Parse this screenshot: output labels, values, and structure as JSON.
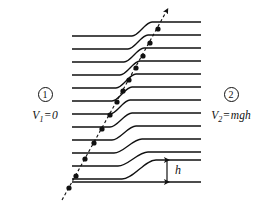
{
  "figure": {
    "kind": "physics-potential-step-diagram",
    "width": 265,
    "height": 216,
    "background_color": "#ffffff",
    "line_color": "#111111"
  },
  "regions": {
    "left": {
      "marker": "1",
      "marker_style": "circled-number",
      "potential_symbol": "V",
      "potential_subscript": "1",
      "equals": "=",
      "potential_value": "0"
    },
    "right": {
      "marker": "2",
      "marker_style": "circled-number",
      "potential_symbol": "V",
      "potential_subscript": "2",
      "equals": "=",
      "potential_value": "mgh"
    }
  },
  "height_marker": {
    "label": "h",
    "arrow": "double-headed-vertical",
    "x": 167,
    "y_top": 160,
    "y_bottom": 182
  },
  "chart_data": {
    "type": "line",
    "title": "",
    "xlabel": "",
    "ylabel": "",
    "grid": false,
    "legend": false,
    "step_lines": {
      "count": 13,
      "left_x": 72,
      "right_x": 201,
      "stroke_width": 1.3,
      "rows": [
        {
          "index": 0,
          "y_left": 36,
          "y_right": 22,
          "step_start_x": 132,
          "step_end_x": 152,
          "has_step": true
        },
        {
          "index": 1,
          "y_left": 49,
          "y_right": 35,
          "step_start_x": 128,
          "step_end_x": 148,
          "has_step": true
        },
        {
          "index": 2,
          "y_left": 62,
          "y_right": 48,
          "step_start_x": 124,
          "step_end_x": 144,
          "has_step": true
        },
        {
          "index": 3,
          "y_left": 75,
          "y_right": 61,
          "step_start_x": 120,
          "step_end_x": 140,
          "has_step": true
        },
        {
          "index": 4,
          "y_left": 88,
          "y_right": 74,
          "step_start_x": 116,
          "step_end_x": 136,
          "has_step": true
        },
        {
          "index": 5,
          "y_left": 101,
          "y_right": 87,
          "step_start_x": 112,
          "step_end_x": 132,
          "has_step": true
        },
        {
          "index": 6,
          "y_left": 114,
          "y_right": 100,
          "step_start_x": 110,
          "step_end_x": 130,
          "has_step": true
        },
        {
          "index": 7,
          "y_left": 127,
          "y_right": 113,
          "step_start_x": 110,
          "step_end_x": 132,
          "has_step": true
        },
        {
          "index": 8,
          "y_left": 140,
          "y_right": 126,
          "step_start_x": 112,
          "step_end_x": 136,
          "has_step": true
        },
        {
          "index": 9,
          "y_left": 153,
          "y_right": 139,
          "step_start_x": 114,
          "step_end_x": 142,
          "has_step": true
        },
        {
          "index": 10,
          "y_left": 166,
          "y_right": 152,
          "step_start_x": 118,
          "step_end_x": 148,
          "has_step": true
        },
        {
          "index": 11,
          "y_left": 179,
          "y_right": 160,
          "step_start_x": 122,
          "step_end_x": 156,
          "has_step": true
        },
        {
          "index": 12,
          "y_left": 182,
          "y_right": 182,
          "step_start_x": 140,
          "step_end_x": 140,
          "has_step": false
        }
      ]
    },
    "trajectory": {
      "style": "dashed",
      "dash_pattern": "3,2.5",
      "stroke_width": 1.1,
      "tail": {
        "x": 62,
        "y": 200
      },
      "head": {
        "x": 166,
        "y": 12
      },
      "arrowhead": true,
      "dots": [
        {
          "x": 69,
          "y": 188
        },
        {
          "x": 76,
          "y": 176
        },
        {
          "x": 85,
          "y": 159
        },
        {
          "x": 94,
          "y": 143
        },
        {
          "x": 102,
          "y": 129
        },
        {
          "x": 110,
          "y": 115
        },
        {
          "x": 117,
          "y": 102
        },
        {
          "x": 123,
          "y": 91
        },
        {
          "x": 129,
          "y": 80
        },
        {
          "x": 136,
          "y": 68
        },
        {
          "x": 143,
          "y": 56
        },
        {
          "x": 150,
          "y": 43
        },
        {
          "x": 158,
          "y": 29
        }
      ],
      "dot_radius": 2.6
    }
  }
}
